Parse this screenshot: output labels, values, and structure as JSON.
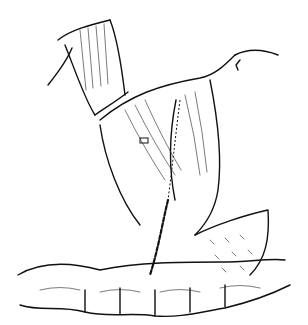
{
  "figure": {
    "type": "medical-line-illustration",
    "colors": {
      "ink": "#111111",
      "background": "#ffffff"
    }
  }
}
